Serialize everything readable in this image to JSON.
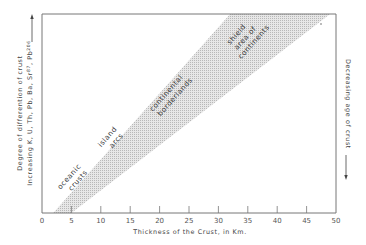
{
  "chart_data": {
    "type": "area",
    "title": "",
    "xlabel": "Thickness of the Crust, in Km.",
    "ylabel_lines": [
      "Degree of differention of crust",
      "Increasing K, U, Th, Pb, Ba, Sr87, Pb206"
    ],
    "ylabel_rich": {
      "prefix": "Increasing K, U, Th, Pb, Ba, Sr",
      "sup1": "87",
      "mid": ", Pb",
      "sup2": "206"
    },
    "right_label": "Decreasing age of crust",
    "xlim": [
      0,
      50
    ],
    "ylim": [
      0,
      1
    ],
    "x_ticks": [
      0,
      5,
      10,
      15,
      20,
      25,
      30,
      35,
      40,
      45,
      50
    ],
    "x_tick_labels": [
      "0",
      "5",
      "10",
      "15",
      "20",
      "25",
      "30",
      "35",
      "40",
      "45",
      "50"
    ],
    "y_ticks": [],
    "grid": false,
    "band": {
      "name": "crust development band",
      "upper_edge": [
        [
          1.9,
          0
        ],
        [
          32.0,
          1
        ]
      ],
      "lower_edge": [
        [
          5.0,
          0
        ],
        [
          49.0,
          1
        ]
      ],
      "fill": "stippled gray"
    },
    "regions": [
      {
        "lines": [
          "oceanic",
          "crusts"
        ],
        "x": 5.5,
        "y": 0.16
      },
      {
        "lines": [
          "island",
          "arcs"
        ],
        "x": 12.0,
        "y": 0.36
      },
      {
        "lines": [
          "continental",
          "borderlands"
        ],
        "x": 22.0,
        "y": 0.58
      },
      {
        "lines": [
          "shield",
          "area of",
          "continents"
        ],
        "x": 34.5,
        "y": 0.86
      }
    ],
    "colors": {
      "axis": "#777777",
      "band": "#c8c8c8",
      "text": "#444444"
    }
  }
}
